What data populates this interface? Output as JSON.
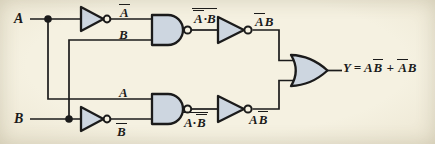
{
  "colors": {
    "background": "#f5f1e1",
    "gate_fill": "#cdd6e0",
    "ink": "#1b1b1b"
  },
  "labels": {
    "input_a": "A",
    "input_b": "B",
    "not_a_out": "{A}",
    "b_to_top_nand": "B",
    "a_to_bottom_nand": "A",
    "not_b_out": "{B}",
    "top_nand_out": "{{A}·B}",
    "bottom_nand_out": "{A·{B}}",
    "top_inverter_out": "{A}B",
    "bottom_inverter_out": "A{B}",
    "output_equation": "Y = A{B} + {A}B"
  },
  "components": [
    {
      "name": "not-gate-top",
      "type": "NOT"
    },
    {
      "name": "not-gate-bottom",
      "type": "NOT"
    },
    {
      "name": "nand-gate-top",
      "type": "NAND"
    },
    {
      "name": "nand-gate-bottom",
      "type": "NAND"
    },
    {
      "name": "inverter-top",
      "type": "NOT"
    },
    {
      "name": "inverter-bottom",
      "type": "NOT"
    },
    {
      "name": "or-gate",
      "type": "OR"
    }
  ]
}
